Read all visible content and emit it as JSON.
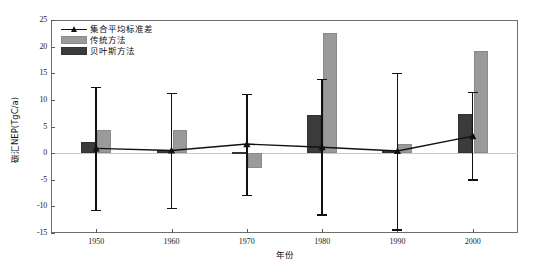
{
  "chart_data": {
    "type": "bar",
    "title": "",
    "subtitle": "",
    "xlabel": "年份",
    "ylabel": "碳汇NEP(TgC/a)",
    "categories": [
      "1950",
      "1960",
      "1970",
      "1980",
      "1990",
      "2000"
    ],
    "x": [
      1950,
      1960,
      1970,
      1980,
      1990,
      2000
    ],
    "ylim": [
      -15,
      25
    ],
    "yticks": [
      25,
      20,
      15,
      10,
      5,
      0,
      -5,
      -10,
      -15
    ],
    "ytick_labels": [
      "25",
      "20",
      "15",
      "10",
      "5",
      "0",
      "-5",
      "-10",
      "-15"
    ],
    "xticks": [
      1950,
      1960,
      1970,
      1980,
      1990,
      2000
    ],
    "xtick_labels": [
      "1950",
      "1960",
      "1970",
      "1980",
      "1990",
      "2000"
    ],
    "xlim": [
      1944,
      2006
    ],
    "grid": false,
    "legend_position": "upper-left",
    "zero_reference_line": 0,
    "series": [
      {
        "name": "集合平均标准差",
        "type": "line",
        "marker": "triangle",
        "color": "#111111",
        "values": [
          0.9,
          0.5,
          1.7,
          1.1,
          0.4,
          3.2
        ],
        "error_low": [
          -10.6,
          -10.3,
          -7.8,
          -11.5,
          -14.3,
          -4.9
        ],
        "error_high": [
          12.5,
          11.3,
          11.1,
          13.9,
          15.1,
          11.5
        ]
      },
      {
        "name": "传统方法",
        "type": "bar",
        "color": "#9a9a9a",
        "values": [
          4.4,
          4.3,
          -2.7,
          22.5,
          1.8,
          19.2
        ]
      },
      {
        "name": "贝叶斯方法",
        "type": "bar",
        "color": "#3b3b3b",
        "values": [
          2.0,
          0.5,
          0.15,
          7.1,
          0.5,
          7.4
        ]
      }
    ]
  },
  "legend": {
    "items": [
      {
        "label": "集合平均标准差",
        "key": "line-marker-key"
      },
      {
        "label": "传统方法",
        "key": "gray-swatch-key"
      },
      {
        "label": "贝叶斯方法",
        "key": "dark-swatch-key"
      }
    ]
  }
}
